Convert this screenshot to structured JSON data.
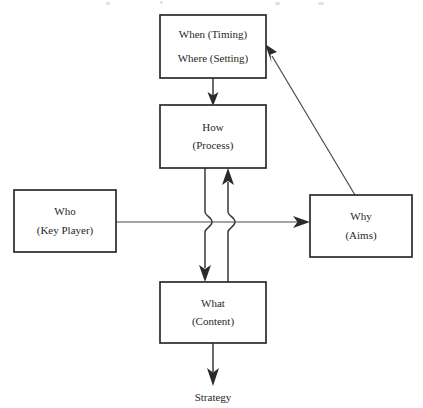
{
  "diagram": {
    "type": "flow-diagram",
    "title": "",
    "background_color": "#ffffff",
    "line_color": "#3a3a3a",
    "text_color": "#272727",
    "nodes": [
      {
        "id": "when-where",
        "name": "when-where-box",
        "line1": "When (Timing)",
        "line2": "Where (Setting)",
        "x": 160,
        "y": 15,
        "width": 106,
        "height": 63
      },
      {
        "id": "how",
        "name": "how-box",
        "line1": "How",
        "line2": "(Process)",
        "x": 160,
        "y": 105,
        "width": 106,
        "height": 63
      },
      {
        "id": "who",
        "name": "who-box",
        "line1": "Who",
        "line2": "(Key Player)",
        "x": 14,
        "y": 190,
        "width": 102,
        "height": 62
      },
      {
        "id": "why",
        "name": "why-box",
        "line1": "Why",
        "line2": "(Aims)",
        "x": 310,
        "y": 195,
        "width": 102,
        "height": 62
      },
      {
        "id": "what",
        "name": "what-box",
        "line1": "What",
        "line2": "(Content)",
        "x": 160,
        "y": 282,
        "width": 106,
        "height": 61
      }
    ],
    "terminal": {
      "id": "strategy",
      "label": "Strategy"
    },
    "edges": [
      {
        "from": "when-where",
        "to": "how",
        "style": "vertical-arrow-down"
      },
      {
        "from": "how",
        "to": "what",
        "style": "vertical-arrow-down-with-jump"
      },
      {
        "from": "what",
        "to": "how",
        "style": "vertical-arrow-up-with-jump"
      },
      {
        "from": "who",
        "to": "why",
        "style": "horizontal-arrow-right"
      },
      {
        "from": "why",
        "to": "when-where",
        "style": "diagonal-arrow-up-left"
      },
      {
        "from": "what",
        "to": "strategy",
        "style": "vertical-arrow-down"
      }
    ]
  }
}
